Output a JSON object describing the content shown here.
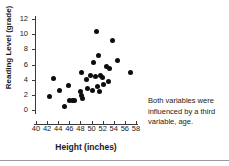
{
  "chart_data": {
    "type": "scatter",
    "title": "",
    "xlabel": "Height (inches)",
    "ylabel": "Reading Level (grade)",
    "xlim": [
      40,
      58
    ],
    "ylim": [
      0,
      12
    ],
    "xticks": [
      40,
      42,
      44,
      46,
      48,
      50,
      52,
      54,
      56,
      58
    ],
    "yticks": [
      0,
      2,
      4,
      6,
      8,
      10,
      12
    ],
    "grid": false,
    "legend": null,
    "marker_color": "#0d0d0d",
    "annotations": [
      {
        "text": "Both variables were influenced by a third variable, age.",
        "x": 60.5,
        "y": 2.8
      }
    ],
    "points": [
      {
        "x": 42.4,
        "y": 1.8
      },
      {
        "x": 43.1,
        "y": 4.1
      },
      {
        "x": 44.3,
        "y": 2.6
      },
      {
        "x": 45.2,
        "y": 0.5
      },
      {
        "x": 45.8,
        "y": 3.2
      },
      {
        "x": 46.0,
        "y": 1.3
      },
      {
        "x": 46.5,
        "y": 1.2
      },
      {
        "x": 47.0,
        "y": 1.2
      },
      {
        "x": 48.0,
        "y": 2.5
      },
      {
        "x": 48.1,
        "y": 5.0
      },
      {
        "x": 48.2,
        "y": 1.9
      },
      {
        "x": 48.4,
        "y": 1.5
      },
      {
        "x": 49.0,
        "y": 4.0
      },
      {
        "x": 49.3,
        "y": 2.9
      },
      {
        "x": 49.8,
        "y": 4.6
      },
      {
        "x": 50.1,
        "y": 2.6
      },
      {
        "x": 50.3,
        "y": 6.3
      },
      {
        "x": 50.7,
        "y": 4.4
      },
      {
        "x": 50.9,
        "y": 10.4
      },
      {
        "x": 51.0,
        "y": 3.1
      },
      {
        "x": 51.2,
        "y": 7.2
      },
      {
        "x": 51.4,
        "y": 2.4
      },
      {
        "x": 51.6,
        "y": 4.5
      },
      {
        "x": 51.9,
        "y": 4.3
      },
      {
        "x": 52.1,
        "y": 3.4
      },
      {
        "x": 52.6,
        "y": 5.8
      },
      {
        "x": 53.0,
        "y": 3.8
      },
      {
        "x": 53.3,
        "y": 5.5
      },
      {
        "x": 53.8,
        "y": 9.2
      },
      {
        "x": 54.6,
        "y": 6.5
      },
      {
        "x": 57.0,
        "y": 5.0
      }
    ]
  }
}
